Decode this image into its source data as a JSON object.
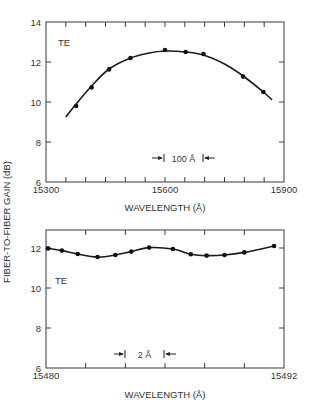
{
  "figure": {
    "ylabel": "FIBER-TO-FIBER GAIN (dB)",
    "line_color": "#1a1a1a",
    "frame_color": "#3a3a3a"
  },
  "chart_data": [
    {
      "type": "line",
      "title": "",
      "annotation": "TE",
      "xlabel": "WAVELENGTH (Å)",
      "ylabel": "FIBER-TO-FIBER GAIN (dB)",
      "xlim": [
        15300,
        15900
      ],
      "ylim": [
        6,
        14
      ],
      "x_tick_labels": [
        "15300",
        "15600",
        "15900"
      ],
      "x_ticks": [
        15300,
        15350,
        15400,
        15450,
        15500,
        15550,
        15600,
        15650,
        15700,
        15750,
        15800,
        15850,
        15900
      ],
      "y_ticks": [
        6,
        8,
        10,
        12,
        14
      ],
      "y_tick_labels": [
        "6",
        "8",
        "10",
        "12",
        "14"
      ],
      "grid": false,
      "resolution_marker": {
        "label": "100 Å",
        "from": 15600,
        "to": 15700,
        "y": 7.2
      },
      "series": [
        {
          "name": "TE measured",
          "marker": "dot",
          "x": [
            15376,
            15415,
            15459,
            15513,
            15600,
            15652,
            15697,
            15797,
            15848
          ],
          "y": [
            9.8,
            10.73,
            11.63,
            12.2,
            12.6,
            12.5,
            12.4,
            11.27,
            10.5
          ]
        },
        {
          "name": "TE fit",
          "marker": "none",
          "x": [
            15350,
            15376,
            15415,
            15459,
            15513,
            15560,
            15600,
            15652,
            15697,
            15750,
            15797,
            15848,
            15870
          ],
          "y": [
            9.25,
            9.9,
            10.8,
            11.65,
            12.2,
            12.45,
            12.55,
            12.5,
            12.35,
            11.9,
            11.3,
            10.5,
            10.1
          ]
        }
      ]
    },
    {
      "type": "line",
      "title": "",
      "annotation": "TE",
      "xlabel": "WAVELENGTH (Å)",
      "ylabel": "FIBER-TO-FIBER GAIN (dB)",
      "xlim": [
        15480,
        15492
      ],
      "ylim": [
        6,
        12.9
      ],
      "x_tick_labels": [
        "15480",
        "15492"
      ],
      "x_ticks": [
        15480,
        15482,
        15484,
        15486,
        15488,
        15490,
        15492
      ],
      "y_ticks": [
        6,
        8,
        10,
        12
      ],
      "y_tick_labels": [
        "6",
        "8",
        "10",
        "12"
      ],
      "grid": false,
      "resolution_marker": {
        "label": "2 Å",
        "from": 15484,
        "to": 15486,
        "y": 6.7
      },
      "series": [
        {
          "name": "TE measured",
          "marker": "dot",
          "x": [
            15480.1,
            15480.8,
            15481.6,
            15482.6,
            15483.5,
            15484.3,
            15485.2,
            15486.4,
            15487.3,
            15488.1,
            15489.0,
            15490.0,
            15491.5
          ],
          "y": [
            11.98,
            11.87,
            11.7,
            11.55,
            11.65,
            11.82,
            12.02,
            11.95,
            11.69,
            11.62,
            11.65,
            11.78,
            12.1
          ]
        }
      ]
    }
  ]
}
